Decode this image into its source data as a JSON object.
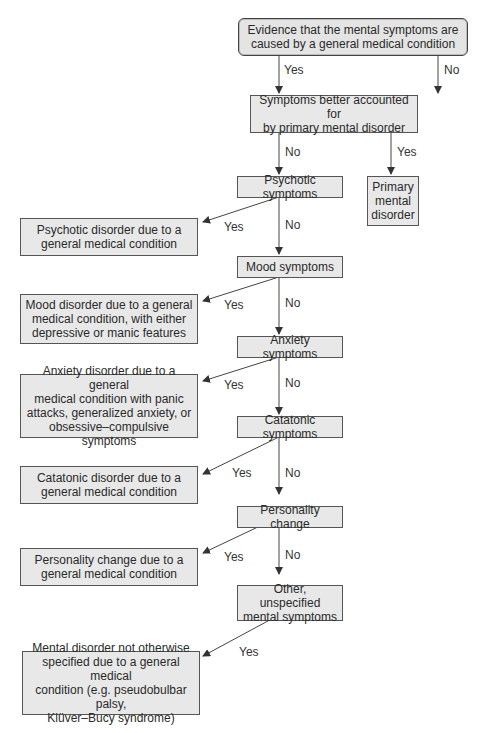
{
  "nodes": {
    "root": "Evidence that the mental symptoms are\ncaused by a general medical condition",
    "better_accounted": "Symptoms better accounted for\nby primary mental disorder",
    "primary": "Primary\nmental\ndisorder",
    "psychotic": "Psychotic symptoms",
    "psychotic_out": "Psychotic disorder due to a\ngeneral medical condition",
    "mood": "Mood symptoms",
    "mood_out": "Mood disorder due to a general\nmedical condition, with either\ndepressive or manic features",
    "anxiety": "Anxiety symptoms",
    "anxiety_out": "Anxiety disorder due to a general\nmedical condition with panic\nattacks, generalized anxiety, or\nobsessive–compulsive symptoms",
    "catatonic": "Catatonic symptoms",
    "catatonic_out": "Catatonic disorder due to a\ngeneral medical condition",
    "personality": "Personality change",
    "personality_out": "Personality change due to a\ngeneral medical condition",
    "other": "Other, unspecified\nmental symptoms",
    "other_out": "Mental disorder not otherwise\nspecified due to a general medical\ncondition (e.g. pseudobulbar palsy,\nKlüver–Bucy syndrome)"
  },
  "labels": {
    "yes": "Yes",
    "no": "No"
  }
}
